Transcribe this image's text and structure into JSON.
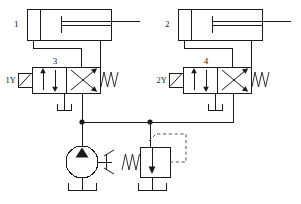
{
  "diagram": {
    "type": "hydraulic-schematic",
    "line_color": "#1a1a1a",
    "pilot_line_color": "#555555",
    "background": "#ffffff"
  },
  "cylinders": [
    {
      "id": "cylinder-1",
      "label": "1",
      "kind": "double-acting-cylinder",
      "rod_side": "right"
    },
    {
      "id": "cylinder-2",
      "label": "2",
      "kind": "double-acting-cylinder",
      "rod_side": "right"
    }
  ],
  "valves": [
    {
      "id": "valve-3",
      "label": "3",
      "kind": "4-2-directional-control-valve",
      "solenoid_label": "1Y",
      "actuator_left": "solenoid",
      "actuator_right": "spring",
      "position_left_flow": "parallel",
      "position_right_flow": "crossed"
    },
    {
      "id": "valve-4",
      "label": "4",
      "kind": "4-2-directional-control-valve",
      "solenoid_label": "2Y",
      "actuator_left": "solenoid",
      "actuator_right": "spring",
      "position_left_flow": "parallel",
      "position_right_flow": "crossed"
    }
  ],
  "pump": {
    "id": "pump",
    "kind": "fixed-displacement-pump",
    "label": "",
    "has_drive_shaft": true,
    "tank_connected": true
  },
  "relief_valve": {
    "id": "relief-valve",
    "kind": "pilot-operated-pressure-relief-valve",
    "label": "",
    "spring_side": "left",
    "pilot_line": "dashed",
    "tank_connected": true
  },
  "tanks": [
    {
      "id": "tank-valve-3",
      "kind": "reservoir"
    },
    {
      "id": "tank-valve-4",
      "kind": "reservoir"
    },
    {
      "id": "tank-pump",
      "kind": "reservoir"
    },
    {
      "id": "tank-relief",
      "kind": "reservoir"
    }
  ],
  "junctions": [
    {
      "id": "junction-pump-line",
      "x": 82,
      "y": 122
    },
    {
      "id": "junction-relief-line",
      "x": 150,
      "y": 122
    }
  ]
}
